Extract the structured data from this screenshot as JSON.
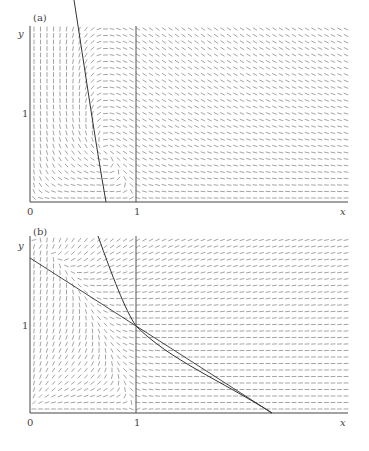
{
  "chart_data": [
    {
      "type": "vector-field",
      "panel_label": "(a)",
      "xlabel": "x",
      "ylabel": "y",
      "x_ticks": [
        "0",
        "1"
      ],
      "y_ticks": [
        "1"
      ],
      "xlim": [
        0,
        2
      ],
      "ylim": [
        0,
        2
      ],
      "grid": false,
      "annotations": [
        "nullcline curve from top-left descending steeply to x≈0.7 at y=0",
        "vertical line at x=1"
      ]
    },
    {
      "type": "vector-field",
      "panel_label": "(b)",
      "xlabel": "x",
      "ylabel": "y",
      "x_ticks": [
        "0",
        "1"
      ],
      "y_ticks": [
        "1"
      ],
      "xlim": [
        0,
        2
      ],
      "ylim": [
        0,
        2
      ],
      "grid": false,
      "annotations": [
        "straight line from (0,1.6) through (1,1) to (2.3,0)",
        "curve from (0.6,2) through (1,1) to (2.3,0)",
        "vertical line at x=1",
        "intersection point at (1,1)"
      ]
    }
  ],
  "panel_a": {
    "label": "(a)",
    "x_axis_label": "x",
    "y_axis_label": "y",
    "origin": "0",
    "x_tick": "1",
    "y_tick": "1"
  },
  "panel_b": {
    "label": "(b)",
    "x_axis_label": "x",
    "y_axis_label": "y",
    "origin": "0",
    "x_tick": "1",
    "y_tick": "1"
  }
}
